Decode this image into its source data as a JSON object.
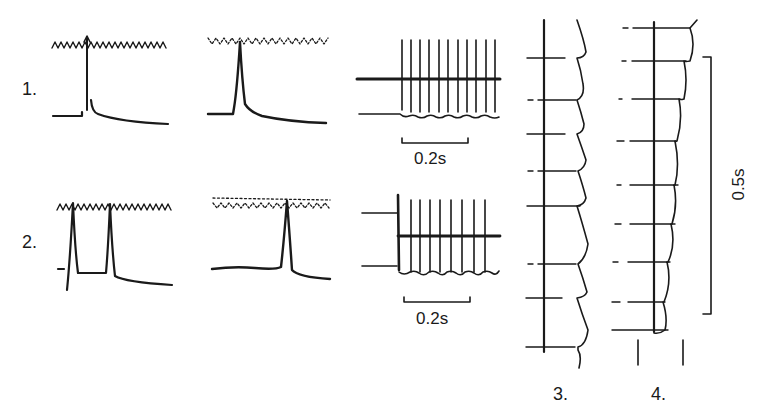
{
  "figure": {
    "type": "electrophysiology-traces",
    "rows": [
      {
        "label": "1.",
        "panels": [
          "single-spike-with-stimulus-train",
          "single-spike-with-stimulus-train",
          "repetitive-firing-train"
        ]
      },
      {
        "label": "2.",
        "panels": [
          "double-spike-with-stimulus-train",
          "single-spike-with-stimulus-train",
          "repetitive-firing-train"
        ]
      }
    ],
    "columns": [
      {
        "label": "3.",
        "description": "vertical sweep stack, 8 sweeps"
      },
      {
        "label": "4.",
        "description": "vertical sweep stack, 9 sweeps"
      }
    ],
    "scale_bars": {
      "row1_time": "0.2s",
      "row2_time": "0.2s",
      "column4_time": "0.5s"
    },
    "colors": {
      "ink": "#1a1a1a",
      "background": "#ffffff"
    }
  }
}
